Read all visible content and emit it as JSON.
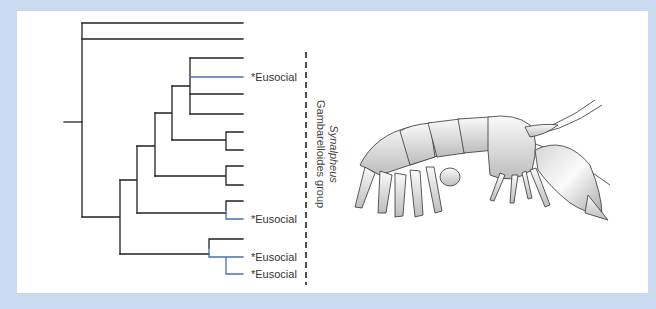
{
  "figure": {
    "type": "phylogenetic-tree",
    "background_color": "#c9d9ef",
    "panel_color": "#ffffff",
    "line_color": "#222222",
    "eusocial_line_color": "#4a6fb5"
  },
  "tree": {
    "leaves": [
      {
        "index": 1,
        "y": 23,
        "label": "",
        "eusocial": false
      },
      {
        "index": 2,
        "y": 39,
        "label": "",
        "eusocial": false
      },
      {
        "index": 3,
        "y": 58,
        "label": "",
        "eusocial": false
      },
      {
        "index": 4,
        "y": 77,
        "label": "*Eusocial",
        "eusocial": true
      },
      {
        "index": 5,
        "y": 94,
        "label": "",
        "eusocial": false
      },
      {
        "index": 6,
        "y": 114,
        "label": "",
        "eusocial": false
      },
      {
        "index": 7,
        "y": 132,
        "label": "",
        "eusocial": false
      },
      {
        "index": 8,
        "y": 150,
        "label": "",
        "eusocial": false
      },
      {
        "index": 9,
        "y": 166,
        "label": "",
        "eusocial": false
      },
      {
        "index": 10,
        "y": 185,
        "label": "",
        "eusocial": false
      },
      {
        "index": 11,
        "y": 201,
        "label": "",
        "eusocial": false
      },
      {
        "index": 12,
        "y": 219,
        "label": "*Eusocial",
        "eusocial": true
      },
      {
        "index": 13,
        "y": 239,
        "label": "",
        "eusocial": false
      },
      {
        "index": 14,
        "y": 257,
        "label": "*Eusocial",
        "eusocial": true
      },
      {
        "index": 15,
        "y": 274,
        "label": "*Eusocial",
        "eusocial": true
      }
    ],
    "labels": {
      "eusocial_1": "*Eusocial",
      "eusocial_2": "*Eusocial",
      "eusocial_3": "*Eusocial",
      "eusocial_4": "*Eusocial"
    }
  },
  "group_bracket": {
    "genus": "Synalpheus",
    "group": "Gambarelloides group",
    "style": "dashed"
  },
  "illustration": {
    "subject": "snapping shrimp",
    "style": "pen-and-ink"
  }
}
